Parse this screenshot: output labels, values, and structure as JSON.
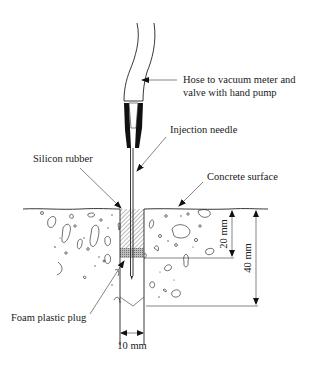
{
  "diagram": {
    "type": "cross-section",
    "labels": {
      "hose": [
        "Hose to vacuum meter and",
        "valve with hand pump"
      ],
      "needle": "Injection needle",
      "silicon": "Silicon rubber",
      "surface": "Concrete surface",
      "plug": "Foam plastic plug"
    },
    "dimensions": {
      "depth_seal": "20 mm",
      "depth_hole": "40 mm",
      "hole_diameter": "10 mm"
    },
    "colors": {
      "line": "#222222",
      "background": "#ffffff",
      "connector": "#111111",
      "foam_plug": "#9a9a9a"
    }
  }
}
